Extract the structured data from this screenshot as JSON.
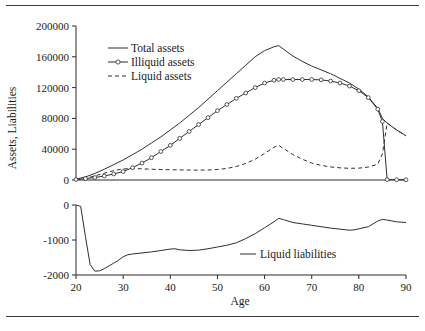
{
  "figure": {
    "top_rule": "horizontal-rule",
    "bottom_rule": "horizontal-rule"
  },
  "chart_data": [
    {
      "type": "line",
      "panel": "upper",
      "title": "",
      "xlabel": "",
      "ylabel": "Assets, Liabilities",
      "xlim": [
        20,
        90
      ],
      "ylim": [
        0,
        200000
      ],
      "xticks": [
        20,
        30,
        40,
        50,
        60,
        70,
        80,
        90
      ],
      "yticks": [
        0,
        40000,
        80000,
        120000,
        160000,
        200000
      ],
      "ytick_labels": [
        "0",
        "40000",
        "80000",
        "120000",
        "160000",
        "200000"
      ],
      "grid": false,
      "legend_position": "upper-left-inside",
      "x": [
        20,
        22,
        24,
        26,
        28,
        30,
        32,
        34,
        36,
        38,
        40,
        42,
        44,
        46,
        48,
        50,
        52,
        54,
        56,
        58,
        60,
        62,
        63,
        64,
        66,
        68,
        70,
        72,
        74,
        76,
        78,
        80,
        82,
        84,
        85,
        86,
        88,
        90
      ],
      "series": [
        {
          "name": "Total assets",
          "style": "solid",
          "marker": "none",
          "values": [
            1000,
            4000,
            8500,
            14000,
            20000,
            26000,
            33000,
            40000,
            48000,
            56000,
            65000,
            74000,
            84000,
            94000,
            105000,
            116000,
            127000,
            138000,
            149000,
            160000,
            168000,
            173000,
            174500,
            170000,
            161000,
            154000,
            148000,
            143000,
            138000,
            132000,
            126000,
            118000,
            108000,
            93000,
            80000,
            74000,
            65000,
            57500
          ]
        },
        {
          "name": "Illiquid assets",
          "style": "solid",
          "marker": "circle",
          "values": [
            600,
            1800,
            3200,
            5200,
            7800,
            11000,
            16000,
            22000,
            29000,
            37000,
            45000,
            54000,
            63000,
            72000,
            81000,
            90000,
            98000,
            106000,
            113000,
            120000,
            126000,
            129500,
            130500,
            130500,
            130500,
            130500,
            130500,
            130000,
            128500,
            126000,
            122000,
            116000,
            107000,
            92000,
            76000,
            500,
            400,
            300
          ]
        },
        {
          "name": "Liquid assets",
          "style": "dashed",
          "marker": "none",
          "values": [
            400,
            2200,
            5300,
            8800,
            12200,
            14400,
            15000,
            14500,
            14000,
            13600,
            13300,
            13100,
            12900,
            12800,
            13000,
            13600,
            15000,
            17500,
            21500,
            27000,
            34500,
            42500,
            45000,
            41000,
            33000,
            27000,
            22000,
            19000,
            17000,
            15800,
            15200,
            15400,
            16800,
            20500,
            34000,
            74000,
            65000,
            57200
          ]
        }
      ]
    },
    {
      "type": "line",
      "panel": "lower",
      "title": "",
      "xlabel": "Age",
      "ylabel": "",
      "xlim": [
        20,
        90
      ],
      "ylim": [
        -2000,
        0
      ],
      "xticks": [
        20,
        30,
        40,
        50,
        60,
        70,
        80,
        90
      ],
      "xtick_labels": [
        "20",
        "30",
        "40",
        "50",
        "60",
        "70",
        "80",
        "90"
      ],
      "yticks": [
        -2000,
        -1000,
        0
      ],
      "ytick_labels": [
        "-2000",
        "-1000",
        "0"
      ],
      "grid": false,
      "legend_position": "inside-right",
      "x": [
        20,
        21,
        22,
        23,
        24,
        25,
        26,
        27,
        28,
        29,
        30,
        31,
        32,
        34,
        36,
        38,
        40,
        41,
        42,
        44,
        46,
        48,
        50,
        52,
        54,
        56,
        58,
        60,
        62,
        63,
        64,
        66,
        68,
        70,
        72,
        74,
        76,
        78,
        79,
        80,
        82,
        84,
        85,
        86,
        88,
        90
      ],
      "series": [
        {
          "name": "Liquid liabilities",
          "style": "solid",
          "marker": "none",
          "values": [
            0,
            -40,
            -900,
            -1700,
            -1890,
            -1880,
            -1820,
            -1740,
            -1660,
            -1580,
            -1480,
            -1420,
            -1400,
            -1370,
            -1340,
            -1300,
            -1260,
            -1250,
            -1280,
            -1300,
            -1290,
            -1250,
            -1200,
            -1150,
            -1080,
            -960,
            -820,
            -650,
            -480,
            -380,
            -420,
            -500,
            -540,
            -580,
            -620,
            -660,
            -690,
            -720,
            -710,
            -680,
            -620,
            -460,
            -410,
            -430,
            -480,
            -500
          ]
        }
      ]
    }
  ],
  "legend_upper": [
    {
      "label": "Total assets",
      "style": "solid",
      "marker": "none"
    },
    {
      "label": "Illiquid assets",
      "style": "solid",
      "marker": "circle"
    },
    {
      "label": "Liquid assets",
      "style": "dashed",
      "marker": "none"
    }
  ],
  "legend_lower": [
    {
      "label": "Liquid liabilities",
      "style": "solid",
      "marker": "none"
    }
  ],
  "labels": {
    "y_axis_title": "Assets, Liabilities",
    "x_axis_title": "Age"
  }
}
